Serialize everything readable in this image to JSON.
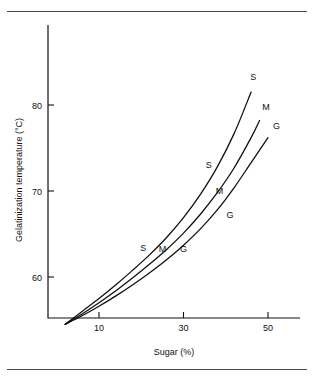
{
  "figure": {
    "name": "gelatinization-temperature-vs-sugar-chart",
    "top_rule": true,
    "bottom_rule": true
  },
  "chart_data": {
    "type": "line",
    "title": "",
    "xlabel": "Sugar (%)",
    "ylabel": "Gelatinization temperature (°C)",
    "xlim": [
      2,
      54
    ],
    "ylim": [
      54,
      84
    ],
    "xticks": [
      10,
      30,
      50
    ],
    "xtick_labels": [
      "10",
      "30",
      "50"
    ],
    "yticks": [
      60,
      70,
      80
    ],
    "ytick_labels": [
      "60",
      "70",
      "80"
    ],
    "grid": false,
    "legend": "inline-curve-labels",
    "series": [
      {
        "name": "S",
        "label": "S",
        "x": [
          2,
          6,
          10,
          14,
          18,
          22,
          26,
          30,
          34,
          38,
          42,
          46
        ],
        "y": [
          54.5,
          56.0,
          57.5,
          59.1,
          60.8,
          62.6,
          64.6,
          66.9,
          69.6,
          72.8,
          76.7,
          81.5
        ]
      },
      {
        "name": "M",
        "label": "M",
        "x": [
          2,
          6,
          10,
          14,
          18,
          22,
          26,
          30,
          34,
          38,
          42,
          46,
          48
        ],
        "y": [
          54.5,
          55.7,
          57.0,
          58.4,
          59.9,
          61.5,
          63.2,
          65.1,
          67.3,
          69.8,
          72.7,
          76.2,
          78.2
        ]
      },
      {
        "name": "G",
        "label": "G",
        "x": [
          2,
          6,
          10,
          14,
          18,
          22,
          26,
          30,
          34,
          38,
          42,
          46,
          50
        ],
        "y": [
          54.5,
          55.5,
          56.6,
          57.8,
          59.1,
          60.5,
          62.0,
          63.7,
          65.6,
          67.8,
          70.4,
          73.3,
          76.2
        ]
      }
    ],
    "inline_labels": [
      {
        "series": "S",
        "text": "S",
        "x": 20.5,
        "y": 63.0
      },
      {
        "series": "M",
        "text": "M",
        "x": 25.0,
        "y": 62.9
      },
      {
        "series": "G",
        "text": "G",
        "x": 30.0,
        "y": 62.9
      },
      {
        "series": "S",
        "text": "S",
        "x": 36.0,
        "y": 72.7
      },
      {
        "series": "M",
        "text": "M",
        "x": 38.5,
        "y": 69.7
      },
      {
        "series": "G",
        "text": "G",
        "x": 41.0,
        "y": 66.9
      },
      {
        "series": "S",
        "text": "S",
        "x": 46.5,
        "y": 82.9
      },
      {
        "series": "M",
        "text": "M",
        "x": 49.5,
        "y": 79.4
      },
      {
        "series": "G",
        "text": "G",
        "x": 52.0,
        "y": 77.2
      }
    ]
  }
}
